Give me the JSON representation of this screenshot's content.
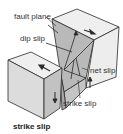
{
  "diagram": {
    "type": "fault-block-diagram",
    "caption": "strike slip",
    "labels": {
      "fault_plane": "fault plane",
      "dip_slip": "dip slip",
      "net_slip": "net slip",
      "strike_slip": "strike slip"
    },
    "colors": {
      "block_face_light": "#ececec",
      "block_face_mid": "#c8c8c8",
      "block_face_dark": "#a9a9a9",
      "outline": "#2a2a2a",
      "text": "#333333"
    }
  }
}
